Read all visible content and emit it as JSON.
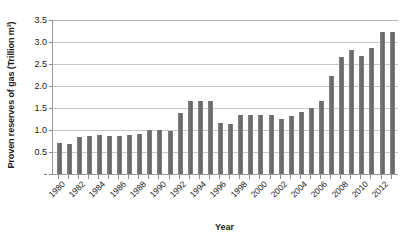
{
  "chart_data": {
    "type": "bar",
    "title": "",
    "xlabel": "Year",
    "ylabel": "Proven reserves of gas  (Trillion m³)",
    "ylim": [
      0,
      3.5
    ],
    "ytick_values": [
      0,
      0.5,
      1.0,
      1.5,
      2.0,
      2.5,
      3.0,
      3.5
    ],
    "ytick_labels": [
      "-",
      "0.5",
      "1.0",
      "1.5",
      "2.0",
      "2.5",
      "3.0",
      "3.5"
    ],
    "grid": true,
    "legend": "none",
    "bar_color": "#6e6e6e",
    "gridline_color": "#c8c8c8",
    "axis_color": "#9a9a9a",
    "categories": [
      "1980",
      "1981",
      "1982",
      "1983",
      "1984",
      "1985",
      "1986",
      "1987",
      "1988",
      "1989",
      "1990",
      "1991",
      "1992",
      "1993",
      "1994",
      "1995",
      "1996",
      "1997",
      "1998",
      "1999",
      "2000",
      "2001",
      "2002",
      "2003",
      "2004",
      "2005",
      "2006",
      "2007",
      "2008",
      "2009",
      "2010",
      "2011",
      "2012",
      "2013"
    ],
    "values": [
      0.7,
      0.69,
      0.84,
      0.87,
      0.88,
      0.87,
      0.86,
      0.88,
      0.91,
      1.01,
      0.99,
      0.98,
      1.38,
      1.65,
      1.65,
      1.65,
      1.15,
      1.14,
      1.34,
      1.35,
      1.35,
      1.35,
      1.25,
      1.31,
      1.42,
      1.51,
      1.66,
      2.22,
      2.66,
      2.81,
      2.69,
      2.87,
      3.23,
      3.23
    ],
    "xtick_labels_shown": [
      "1980",
      "1982",
      "1984",
      "1986",
      "1988",
      "1990",
      "1992",
      "1994",
      "1996",
      "1998",
      "2000",
      "2002",
      "2004",
      "2006",
      "2008",
      "2010",
      "2012"
    ]
  }
}
